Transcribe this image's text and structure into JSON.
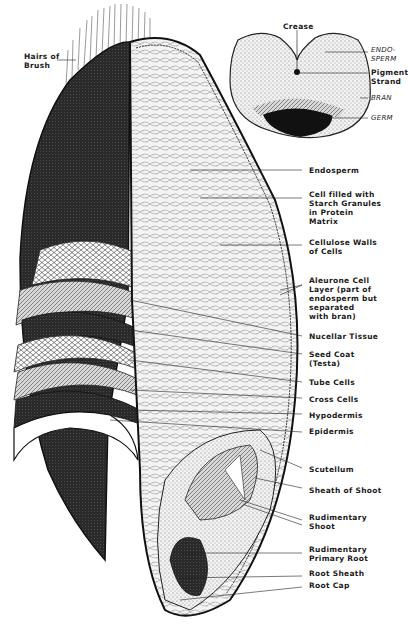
{
  "diagram": {
    "cross_section": {
      "labels": {
        "crease": "Crease",
        "endosperm": "ENDO-\nSPERM",
        "pigment": "Pigment\nStrand",
        "bran": "BRAN",
        "germ": "GERM"
      }
    },
    "longitudinal": {
      "labels": {
        "hairs": "Hairs of\nBrush",
        "endosperm": "Endosperm",
        "starch": "Cell filled with\nStarch Granules\nin Protein\nMatrix",
        "cellulose": "Cellulose Walls\nof Cells",
        "aleurone": "Aleurone Cell\nLayer (part of\nendosperm but\nseparated\nwith bran)",
        "nucellar": "Nucellar Tissue",
        "seedcoat": "Seed Coat\n(Testa)",
        "tube": "Tube Cells",
        "cross": "Cross Cells",
        "hypodermis": "Hypodermis",
        "epidermis": "Epidermis",
        "scutellum": "Scutellum",
        "sheath_shoot": "Sheath of Shoot",
        "rud_shoot": "Rudimentary\nShoot",
        "rud_root": "Rudimentary\nPrimary Root",
        "root_sheath": "Root Sheath",
        "root_cap": "Root Cap"
      }
    }
  }
}
